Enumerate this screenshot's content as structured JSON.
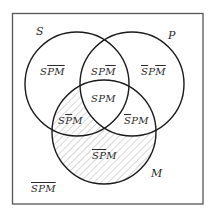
{
  "diagram": {
    "type": "venn-3-set",
    "frame": {
      "x": 12,
      "y": 13,
      "width": 191,
      "height": 191,
      "stroke": "#555555"
    },
    "circles": [
      {
        "name": "S",
        "cx": 77,
        "cy": 84,
        "r": 52
      },
      {
        "name": "P",
        "cx": 132,
        "cy": 84,
        "r": 52
      },
      {
        "name": "M",
        "cx": 104,
        "cy": 132,
        "r": 52
      }
    ],
    "shaded_regions": [
      "S P̄ M",
      "S̄ P̄ M"
    ],
    "colors": {
      "stroke": "#1a1a1a",
      "hatch": "#b0b0b0",
      "text": "#2a2a2a",
      "background": "#ffffff"
    },
    "set_labels": {
      "S": "S",
      "P": "P",
      "M": "M"
    },
    "regions": {
      "s_notp_notm": {
        "plain": "S",
        "over": "PM",
        "text": "S P̄ M̄"
      },
      "s_p_notm": {
        "plain": "SP",
        "over": "M",
        "text": "S P M̄"
      },
      "nots_p_notm": {
        "over1": "S",
        "plain": "P",
        "over2": "M",
        "text": "S̄ P M̄"
      },
      "s_p_m": {
        "plain": "SPM",
        "text": "S P M"
      },
      "s_notp_m": {
        "plain1": "S",
        "over": "P",
        "plain2": "M",
        "text": "S P̄ M"
      },
      "nots_p_m": {
        "over": "S",
        "plain": "PM",
        "text": "S̄ P M"
      },
      "nots_notp_m": {
        "over": "SP",
        "plain": "M",
        "text": "S̄ P̄ M"
      },
      "nots_notp_notm": {
        "over": "SPM",
        "text": "S̄ P̄ M̄"
      }
    }
  }
}
